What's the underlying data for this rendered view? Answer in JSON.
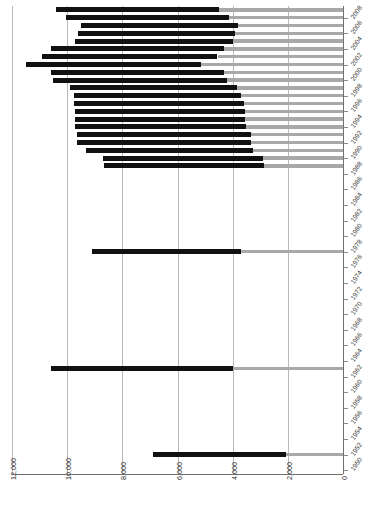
{
  "chart_data": {
    "type": "bar",
    "orientation": "horizontal",
    "title": "",
    "subtitle": "",
    "xlabel": "",
    "ylabel": "",
    "xlim": [
      12000,
      0
    ],
    "x_axis_reversed": true,
    "grid": true,
    "legend": null,
    "xticks": [
      "12,000",
      "10,000",
      "8,000",
      "6,000",
      "4,000",
      "2,000",
      "0"
    ],
    "xtick_values": [
      12000,
      10000,
      8000,
      6000,
      4000,
      2000,
      0
    ],
    "ytick_labels": [
      "2008",
      "2006",
      "2004",
      "2002",
      "2000",
      "1998",
      "1996",
      "1994",
      "1992",
      "1990",
      "1988",
      "1986",
      "1984",
      "1982",
      "1980",
      "1978",
      "1976",
      "1974",
      "1972",
      "1970",
      "1968",
      "1966",
      "1964",
      "1962",
      "1960",
      "1958",
      "1956",
      "1954",
      "1952",
      "1950"
    ],
    "series": [
      {
        "name": "dark-segment",
        "color": "#111111"
      },
      {
        "name": "light-segment",
        "color": "#a8a8a8"
      }
    ],
    "categories": [
      "2009",
      "2008",
      "2007",
      "2006",
      "2005",
      "2004",
      "2003",
      "2002",
      "2001",
      "2000",
      "1999",
      "1998",
      "1997",
      "1996",
      "1995",
      "1994",
      "1993",
      "1992",
      "1991",
      "1990",
      "1989",
      "1988",
      "1987",
      "1986",
      "1985",
      "1984",
      "1983",
      "1982",
      "1981",
      "1980",
      "1979",
      "1978",
      "1977",
      "1976",
      "1975",
      "1974",
      "1973",
      "1972",
      "1971",
      "1970",
      "1969",
      "1968",
      "1967",
      "1966",
      "1965",
      "1964",
      "1963",
      "1962",
      "1961",
      "1960",
      "1959",
      "1958",
      "1957",
      "1956",
      "1955",
      "1954",
      "1953",
      "1952",
      "1951",
      "1950"
    ],
    "bars": [
      {
        "year": "2009",
        "total": 10400,
        "dark": 5900,
        "light": 4500
      },
      {
        "year": "2008",
        "total": 10050,
        "dark": 5900,
        "light": 4150
      },
      {
        "year": "2007",
        "total": 9500,
        "dark": 5700,
        "light": 3800
      },
      {
        "year": "2006",
        "total": 9600,
        "dark": 5700,
        "light": 3900
      },
      {
        "year": "2005",
        "total": 9700,
        "dark": 5700,
        "light": 4000
      },
      {
        "year": "2004",
        "total": 10600,
        "dark": 6300,
        "light": 4300
      },
      {
        "year": "2003",
        "total": 10900,
        "dark": 6350,
        "light": 4550
      },
      {
        "year": "2002",
        "total": 11500,
        "dark": 6350,
        "light": 5150
      },
      {
        "year": "2001",
        "total": 10600,
        "dark": 6300,
        "light": 4300
      },
      {
        "year": "2000",
        "total": 10500,
        "dark": 6300,
        "light": 4200
      },
      {
        "year": "1999",
        "total": 9900,
        "dark": 6050,
        "light": 3850
      },
      {
        "year": "1998",
        "total": 9750,
        "dark": 6050,
        "light": 3700
      },
      {
        "year": "1997",
        "total": 9750,
        "dark": 6150,
        "light": 3600
      },
      {
        "year": "1996",
        "total": 9700,
        "dark": 6150,
        "light": 3550
      },
      {
        "year": "1995",
        "total": 9700,
        "dark": 6150,
        "light": 3550
      },
      {
        "year": "1994",
        "total": 9700,
        "dark": 6200,
        "light": 3500
      },
      {
        "year": "1993",
        "total": 9650,
        "dark": 6300,
        "light": 3350
      },
      {
        "year": "1992",
        "total": 9650,
        "dark": 6300,
        "light": 3350
      },
      {
        "year": "1991",
        "total": 9300,
        "dark": 6050,
        "light": 3250
      },
      {
        "year": "1990",
        "total": 8700,
        "dark": 5800,
        "light": 2900
      },
      {
        "year": "1989",
        "total": 8650,
        "dark": 5800,
        "light": 2850
      },
      {
        "year": "1988",
        "total": 0,
        "dark": 0,
        "light": 0
      },
      {
        "year": "1987",
        "total": 0,
        "dark": 0,
        "light": 0
      },
      {
        "year": "1986",
        "total": 0,
        "dark": 0,
        "light": 0
      },
      {
        "year": "1985",
        "total": 0,
        "dark": 0,
        "light": 0
      },
      {
        "year": "1984",
        "total": 0,
        "dark": 0,
        "light": 0
      },
      {
        "year": "1983",
        "total": 0,
        "dark": 0,
        "light": 0
      },
      {
        "year": "1982",
        "total": 0,
        "dark": 0,
        "light": 0
      },
      {
        "year": "1981",
        "total": 0,
        "dark": 0,
        "light": 0
      },
      {
        "year": "1980",
        "total": 0,
        "dark": 0,
        "light": 0
      },
      {
        "year": "1979",
        "total": 0,
        "dark": 0,
        "light": 0
      },
      {
        "year": "1978",
        "total": 9100,
        "dark": 5400,
        "light": 3700
      },
      {
        "year": "1977",
        "total": 0,
        "dark": 0,
        "light": 0
      },
      {
        "year": "1976",
        "total": 0,
        "dark": 0,
        "light": 0
      },
      {
        "year": "1975",
        "total": 0,
        "dark": 0,
        "light": 0
      },
      {
        "year": "1974",
        "total": 0,
        "dark": 0,
        "light": 0
      },
      {
        "year": "1973",
        "total": 0,
        "dark": 0,
        "light": 0
      },
      {
        "year": "1972",
        "total": 0,
        "dark": 0,
        "light": 0
      },
      {
        "year": "1971",
        "total": 0,
        "dark": 0,
        "light": 0
      },
      {
        "year": "1970",
        "total": 0,
        "dark": 0,
        "light": 0
      },
      {
        "year": "1969",
        "total": 0,
        "dark": 0,
        "light": 0
      },
      {
        "year": "1968",
        "total": 0,
        "dark": 0,
        "light": 0
      },
      {
        "year": "1967",
        "total": 0,
        "dark": 0,
        "light": 0
      },
      {
        "year": "1966",
        "total": 0,
        "dark": 0,
        "light": 0
      },
      {
        "year": "1965",
        "total": 0,
        "dark": 0,
        "light": 0
      },
      {
        "year": "1964",
        "total": 0,
        "dark": 0,
        "light": 0
      },
      {
        "year": "1963",
        "total": 10600,
        "dark": 6600,
        "light": 4000
      },
      {
        "year": "1962",
        "total": 0,
        "dark": 0,
        "light": 0
      },
      {
        "year": "1961",
        "total": 0,
        "dark": 0,
        "light": 0
      },
      {
        "year": "1960",
        "total": 0,
        "dark": 0,
        "light": 0
      },
      {
        "year": "1959",
        "total": 0,
        "dark": 0,
        "light": 0
      },
      {
        "year": "1958",
        "total": 0,
        "dark": 0,
        "light": 0
      },
      {
        "year": "1957",
        "total": 0,
        "dark": 0,
        "light": 0
      },
      {
        "year": "1956",
        "total": 0,
        "dark": 0,
        "light": 0
      },
      {
        "year": "1955",
        "total": 0,
        "dark": 0,
        "light": 0
      },
      {
        "year": "1954",
        "total": 0,
        "dark": 0,
        "light": 0
      },
      {
        "year": "1953",
        "total": 0,
        "dark": 0,
        "light": 0
      },
      {
        "year": "1952",
        "total": 6900,
        "dark": 4850,
        "light": 2050
      },
      {
        "year": "1951",
        "total": 0,
        "dark": 0,
        "light": 0
      },
      {
        "year": "1950",
        "total": 0,
        "dark": 0,
        "light": 0
      }
    ]
  },
  "geometry": {
    "plot_left_px": 12,
    "plot_right_px": 343,
    "plot_top_px": 6,
    "plot_bottom_px": 474,
    "row_height_px": 7.8,
    "bar_height_px": 5.2
  }
}
